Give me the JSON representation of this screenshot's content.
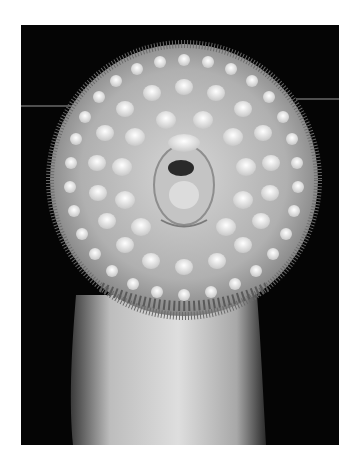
{
  "image": {
    "subject": "lamprey oral disc",
    "description": "Grayscale photograph of a lamprey's circular sucker mouth with concentric rows of teeth, on a black background",
    "colors": {
      "border": "#ffffff",
      "background": "#050505",
      "disc_rim": "#8a8a8a",
      "teeth": "#f2f2f2",
      "disc_fill": "#b8b8b8",
      "body": "#cfcfcf"
    }
  }
}
